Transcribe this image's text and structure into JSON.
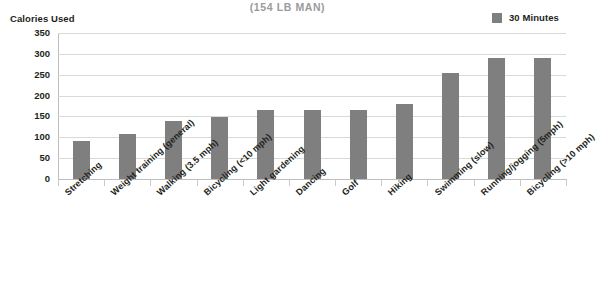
{
  "chart_data": {
    "type": "bar",
    "title": "(154 LB MAN)",
    "xlabel": "",
    "ylabel": "Calories Used",
    "ylim": [
      0,
      350
    ],
    "yticks": [
      0,
      50,
      100,
      150,
      200,
      250,
      300,
      350
    ],
    "grid": true,
    "legend_position": "top-right",
    "legend": [
      "30 Minutes"
    ],
    "series": [
      {
        "name": "30 Minutes",
        "color": "#7f7f7f",
        "values": [
          90,
          108,
          140,
          148,
          165,
          165,
          165,
          180,
          255,
          290,
          290
        ]
      }
    ],
    "categories": [
      "Stretching",
      "Weight training (general)",
      "Walking (3.5 mph)",
      "Bicycling (<10 mph)",
      "Light gardening",
      "Dancing",
      "Golf",
      "Hiking",
      "Swimming (slow)",
      "Running/jogging (5mph)",
      "Bicycling (>10 mph)"
    ]
  },
  "colors": {
    "bar": "#7f7f7f",
    "grid": "#d9d9d9",
    "axis": "#bdbdbd",
    "title": "#9b9b9b",
    "text": "#231f20"
  }
}
